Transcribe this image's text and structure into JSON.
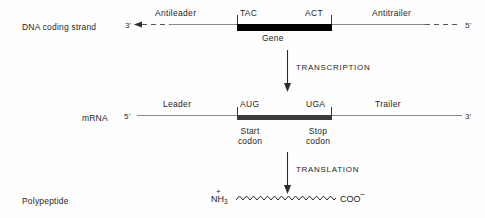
{
  "diagram": {
    "colors": {
      "gene_box": "#000000",
      "mrna_box": "#3a3a3a",
      "line": "#8a8a8a",
      "arrow": "#2b2b2b",
      "text": "#242424",
      "background": "#fefefe"
    },
    "rows": {
      "dna": {
        "label": "DNA coding strand",
        "left_end": "3'",
        "right_end": "5'",
        "left_region": "Antileader",
        "right_region": "Antitrailer",
        "box_left_codon": "TAC",
        "box_right_codon": "ACT",
        "box_caption": "Gene"
      },
      "mrna": {
        "label": "mRNA",
        "left_end": "5'",
        "right_end": "3'",
        "left_region": "Leader",
        "right_region": "Trailer",
        "box_left_codon": "AUG",
        "box_right_codon": "UGA",
        "start_caption_line1": "Start",
        "start_caption_line2": "codon",
        "stop_caption_line1": "Stop",
        "stop_caption_line2": "codon"
      },
      "polypeptide": {
        "label": "Polypeptide",
        "n_terminus": "NH",
        "n_terminus_sub": "3",
        "n_terminus_charge": "+",
        "c_terminus": "COO",
        "c_terminus_charge": "−"
      }
    },
    "steps": {
      "transcription": "TRANSCRIPTION",
      "translation": "TRANSLATION"
    }
  }
}
